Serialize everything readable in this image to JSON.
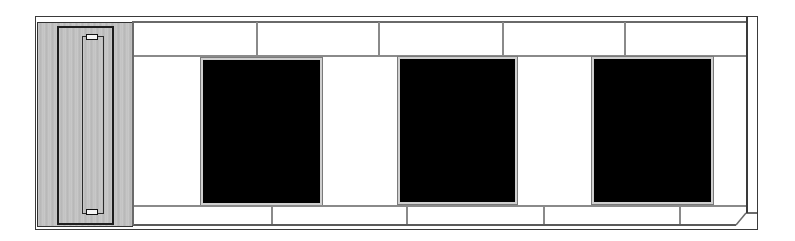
{
  "drawing": {
    "type": "building-elevation",
    "elements": {
      "door": {
        "material": "wood-grain",
        "hardware": [
          "top-hinge",
          "bottom-hinge"
        ]
      },
      "windows": [
        {
          "id": "window-1"
        },
        {
          "id": "window-2"
        },
        {
          "id": "window-3"
        }
      ],
      "upper_band_joints": 4,
      "lower_band_joints": 4
    },
    "colors": {
      "line": "#8a8a8a",
      "frame": "#3a3a3a",
      "glass": "#000000",
      "wood": "#bdbdbd",
      "background": "#ffffff"
    }
  }
}
